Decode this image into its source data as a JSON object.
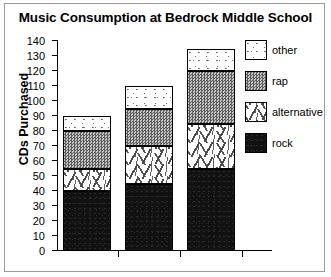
{
  "chart_data": {
    "type": "bar",
    "subtype": "stacked-bar",
    "title": "Music Consumption at Bedrock Middle School",
    "xlabel": "",
    "ylabel": "CDs Purchased",
    "categories": [
      "6th graders",
      "7th graders",
      "8th graders"
    ],
    "ylim": [
      0,
      140
    ],
    "ytick_step": 10,
    "yticks": [
      0,
      10,
      20,
      30,
      40,
      50,
      60,
      70,
      80,
      90,
      100,
      110,
      120,
      130,
      140
    ],
    "ytick_labels": [
      "0",
      "10",
      "20",
      "30",
      "40",
      "50",
      "60",
      "70",
      "80",
      "90",
      "100",
      "110",
      "120",
      "130",
      "140"
    ],
    "grid": false,
    "legend_position": "right",
    "series": [
      {
        "name": "rock",
        "pattern": "solid-black",
        "color": "#111111",
        "values": [
          40,
          45,
          55
        ]
      },
      {
        "name": "alternative",
        "pattern": "sparse-dashes-on-white",
        "color": "#ffffff",
        "values": [
          15,
          25,
          30
        ]
      },
      {
        "name": "rap",
        "pattern": "gray-checkerboard",
        "color": "#8e8e8e",
        "values": [
          25,
          25,
          35
        ]
      },
      {
        "name": "other",
        "pattern": "fine-speckle-on-white",
        "color": "#ffffff",
        "values": [
          10,
          15,
          15
        ]
      }
    ],
    "stack_order_bottom_to_top": [
      "rock",
      "alternative",
      "rap",
      "other"
    ],
    "segment_tops": {
      "6th graders": {
        "rock": 40,
        "alternative": 55,
        "rap": 80,
        "other": 90
      },
      "7th graders": {
        "rock": 45,
        "alternative": 70,
        "rap": 95,
        "other": 110
      },
      "8th graders": {
        "rock": 55,
        "alternative": 85,
        "rap": 120,
        "other": 135
      }
    },
    "totals": [
      90,
      110,
      135
    ]
  },
  "legend": {
    "entries": [
      {
        "label": "other"
      },
      {
        "label": "rap"
      },
      {
        "label": "alternative"
      },
      {
        "label": "rock"
      }
    ]
  },
  "axis": {
    "y_title": "CDs Purchased"
  }
}
